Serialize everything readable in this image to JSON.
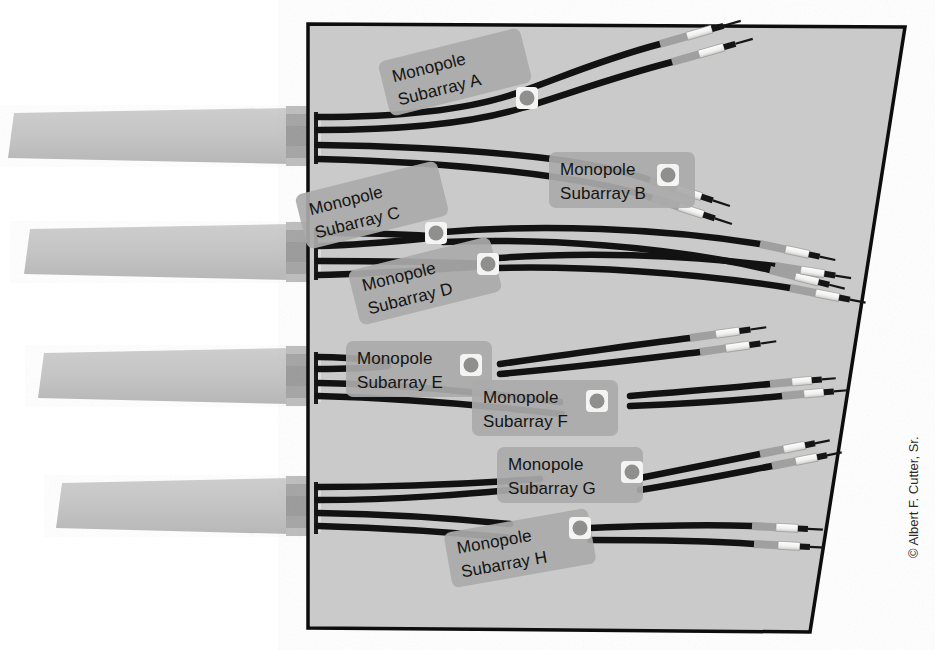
{
  "figure": {
    "kind": "technical-illustration",
    "background_color": "#ffffff",
    "panel_fill": "#c9cac9",
    "panel_border": "#0d0d0d",
    "waveguide_fill": "#c2c3c2",
    "connector_block_fill": "#a6a7a6",
    "cable_color": "#121212",
    "label_bg": "#a9aaa9",
    "label_text_color": "#141414",
    "grommet_fill": "#f2f2f0",
    "grommet_dot": "#8e8f8e",
    "sleeve_light": "#f4f4f2",
    "sleeve_gray": "#a8a9a8"
  },
  "labels": [
    {
      "id": "A",
      "line1": "Monopole",
      "line2": "Subarray A",
      "x": 455,
      "y": 72,
      "rotate": -14,
      "w": 146,
      "h": 56
    },
    {
      "id": "B",
      "line1": "Monopole",
      "line2": "Subarray B",
      "x": 622,
      "y": 180,
      "rotate": 0,
      "w": 146,
      "h": 56
    },
    {
      "id": "C",
      "line1": "Monopole",
      "line2": "Subarray C",
      "x": 372,
      "y": 205,
      "rotate": -14,
      "w": 146,
      "h": 56
    },
    {
      "id": "D",
      "line1": "Monopole",
      "line2": "Subarray D",
      "x": 425,
      "y": 281,
      "rotate": -14,
      "w": 146,
      "h": 56
    },
    {
      "id": "E",
      "line1": "Monopole",
      "line2": "Subarray E",
      "x": 419,
      "y": 369,
      "rotate": 0,
      "w": 146,
      "h": 56
    },
    {
      "id": "F",
      "line1": "Monopole",
      "line2": "Subarray F",
      "x": 545,
      "y": 408,
      "rotate": 0,
      "w": 146,
      "h": 56
    },
    {
      "id": "G",
      "line1": "Monopole",
      "line2": "Subarray G",
      "x": 570,
      "y": 475,
      "rotate": 0,
      "w": 146,
      "h": 56
    },
    {
      "id": "H",
      "line1": "Monopole",
      "line2": "Subarray H",
      "x": 520,
      "y": 548,
      "rotate": -10,
      "w": 146,
      "h": 56
    }
  ],
  "credit": {
    "text": "© Albert F. Cutter, Sr.",
    "x": 918,
    "y": 558,
    "rotate": -90
  },
  "waveguides": [
    {
      "id": "wg-1",
      "top_left_x": 14,
      "top_y": 113,
      "bottom_left_x": 8,
      "bottom_y": 158,
      "right_x": 290
    },
    {
      "id": "wg-2",
      "top_left_x": 30,
      "top_y": 229,
      "bottom_left_x": 24,
      "bottom_y": 274,
      "right_x": 290
    },
    {
      "id": "wg-3",
      "top_left_x": 44,
      "top_y": 353,
      "bottom_left_x": 38,
      "bottom_y": 398,
      "right_x": 290
    },
    {
      "id": "wg-4",
      "top_left_x": 62,
      "top_y": 483,
      "bottom_left_x": 56,
      "bottom_y": 528,
      "right_x": 290
    }
  ],
  "connector_blocks": [
    {
      "id": "cb-1",
      "x": 288,
      "y": 108,
      "w": 24,
      "h": 56
    },
    {
      "id": "cb-2",
      "x": 288,
      "y": 224,
      "w": 24,
      "h": 56
    },
    {
      "id": "cb-3",
      "x": 288,
      "y": 348,
      "w": 24,
      "h": 56
    },
    {
      "id": "cb-4",
      "x": 288,
      "y": 478,
      "w": 24,
      "h": 56
    }
  ],
  "main_panel": {
    "id": "array-face-panel",
    "points": "308,24 905,27 810,632 308,628"
  },
  "harness_groups": [
    {
      "id": "group-1",
      "subarrays": [
        "A",
        "B"
      ],
      "fan_origin_x": 316,
      "fan_origin_y": 136
    },
    {
      "id": "group-2",
      "subarrays": [
        "C",
        "D"
      ],
      "fan_origin_x": 316,
      "fan_origin_y": 252
    },
    {
      "id": "group-3",
      "subarrays": [
        "E",
        "F"
      ],
      "fan_origin_x": 316,
      "fan_origin_y": 376
    },
    {
      "id": "group-4",
      "subarrays": [
        "G",
        "H"
      ],
      "fan_origin_x": 316,
      "fan_origin_y": 506
    }
  ],
  "cable_terminations": [
    {
      "for": "A",
      "count": 2
    },
    {
      "for": "B",
      "count": 2
    },
    {
      "for": "C",
      "count": 2
    },
    {
      "for": "D",
      "count": 2
    },
    {
      "for": "E",
      "count": 2
    },
    {
      "for": "F",
      "count": 2
    },
    {
      "for": "G",
      "count": 2
    },
    {
      "for": "H",
      "count": 2
    }
  ]
}
